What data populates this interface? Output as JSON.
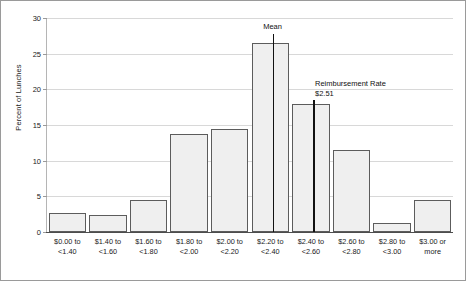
{
  "chart_data": {
    "type": "bar",
    "title": "",
    "subtitle": "",
    "xlabel": "",
    "ylabel": "Percent of Lunches",
    "ylim": [
      0,
      30
    ],
    "yticks": [
      0,
      5,
      10,
      15,
      20,
      25,
      30
    ],
    "ytick_labels": [
      "0",
      "5",
      "10",
      "15",
      "20",
      "25",
      "30"
    ],
    "grid": "horizontal",
    "legend": "none",
    "categories": [
      "$0.00 to\n<1.40",
      "$1.40 to\n<1.60",
      "$1.60 to\n<1.80",
      "$1.80 to\n<2.00",
      "$2.00 to\n<2.20",
      "$2.20 to\n<2.40",
      "$2.40 to\n<2.60",
      "$2.60 to\n<2.80",
      "$2.80 to\n<3.00",
      "$3.00 or\nmore"
    ],
    "values": [
      2.6,
      2.4,
      4.5,
      13.7,
      14.5,
      26.5,
      17.9,
      11.5,
      1.2,
      4.5
    ],
    "bar_fill_color": "#efefef",
    "bar_edge_color": "#5c5c5c",
    "grid_color": "#d8d8d8",
    "annotations": [
      {
        "name": "mean",
        "label_line1": "Mean",
        "label_line2": "",
        "category_index": 5,
        "x_fraction": 0.555,
        "top_value": 27.8,
        "color": "#111111"
      },
      {
        "name": "reimbursement-rate",
        "label_line1": "Reimbursement Rate",
        "label_line2": "$2.51",
        "category_index": 6,
        "x_fraction": 0.552,
        "top_value": 18.5,
        "color": "#111111"
      }
    ]
  }
}
